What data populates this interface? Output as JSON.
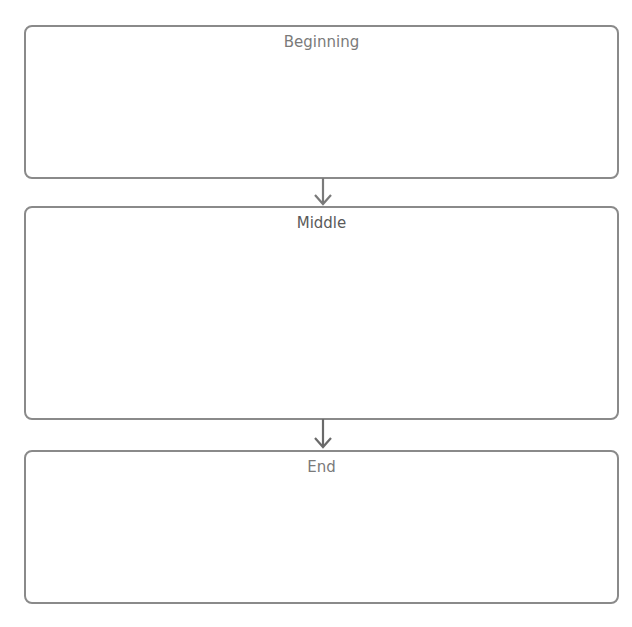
{
  "diagram": {
    "type": "flow",
    "direction": "vertical",
    "stroke_color": "#8a8a8a",
    "nodes": [
      {
        "id": "beginning",
        "label": "Beginning"
      },
      {
        "id": "middle",
        "label": "Middle"
      },
      {
        "id": "end",
        "label": "End"
      }
    ],
    "edges": [
      {
        "from": "beginning",
        "to": "middle"
      },
      {
        "from": "middle",
        "to": "end"
      }
    ]
  }
}
